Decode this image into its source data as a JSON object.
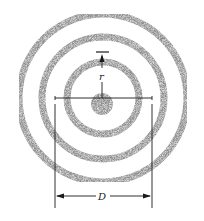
{
  "diagram": {
    "labels": {
      "radius": "r",
      "diameter": "D"
    },
    "center": [
      102,
      100
    ],
    "rings": [
      {
        "name": "outer-ring",
        "radius": 85,
        "width": 7
      },
      {
        "name": "middle-ring",
        "radius": 61,
        "width": 7
      },
      {
        "name": "inner-ring",
        "radius": 36,
        "width": 7
      }
    ],
    "core_radius": 12,
    "colors": {
      "ring": "#9a9a9a",
      "line": "#1a1a1a"
    }
  }
}
